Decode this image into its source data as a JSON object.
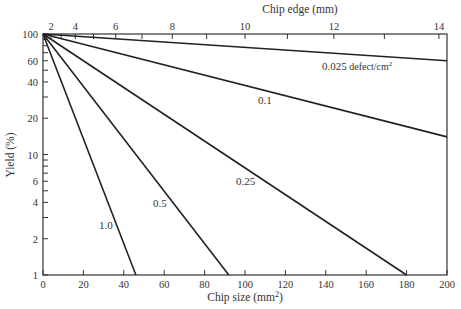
{
  "chart_data": {
    "type": "line",
    "title": "",
    "xlabel": "Chip size (mm²)",
    "ylabel": "Yield (%)",
    "top_xlabel": "Chip edge (mm)",
    "xlim": [
      0,
      200
    ],
    "ylim": [
      1,
      100
    ],
    "yscale": "log",
    "grid": false,
    "x_ticks": [
      0,
      20,
      40,
      60,
      80,
      100,
      120,
      140,
      160,
      180,
      200
    ],
    "y_ticks": [
      1,
      2,
      4,
      6,
      10,
      20,
      40,
      60,
      100
    ],
    "top_x_ticks": [
      2,
      4,
      6,
      8,
      10,
      12,
      14
    ],
    "series": [
      {
        "name": "0.025 defect/cm²",
        "label": "0.025",
        "x": [
          0,
          200
        ],
        "y": [
          100,
          60
        ]
      },
      {
        "name": "0.1",
        "label": "0.1",
        "x": [
          0,
          200
        ],
        "y": [
          100,
          14
        ]
      },
      {
        "name": "0.25",
        "label": "0.25",
        "x": [
          0,
          180
        ],
        "y": [
          100,
          1
        ]
      },
      {
        "name": "0.5",
        "label": "0.5",
        "x": [
          0,
          92
        ],
        "y": [
          100,
          1
        ]
      },
      {
        "name": "1.0",
        "label": "1.0",
        "x": [
          0,
          46
        ],
        "y": [
          100,
          1
        ]
      }
    ]
  },
  "labels": {
    "top_axis": "Chip edge (mm)",
    "bottom_axis": "Chip size (mm",
    "bottom_axis_sup": "2",
    "bottom_axis_close": ")",
    "y_axis": "Yield (%)",
    "series_0025": "0.025",
    "series_0025_unit": " defect/cm",
    "series_0025_sup": "2",
    "series_01": "0.1",
    "series_025": "0.25",
    "series_05": "0.5",
    "series_10": "1.0"
  },
  "ticks": {
    "x": [
      "0",
      "20",
      "40",
      "60",
      "80",
      "100",
      "120",
      "140",
      "160",
      "180",
      "200"
    ],
    "y": [
      "1",
      "2",
      "4",
      "6",
      "10",
      "20",
      "40",
      "60",
      "100"
    ],
    "top": [
      "2",
      "4",
      "6",
      "8",
      "10",
      "12",
      "14"
    ]
  }
}
